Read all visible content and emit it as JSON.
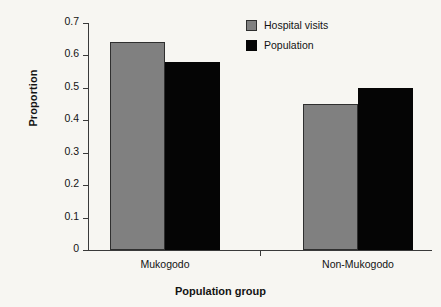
{
  "chart_data": {
    "type": "bar",
    "title": "",
    "xlabel": "Population group",
    "ylabel": "Proportion",
    "categories": [
      "Mukogodo",
      "Non-Mukogodo"
    ],
    "series": [
      {
        "name": "Hospital visits",
        "color": "#808080",
        "values": [
          0.64,
          0.45
        ]
      },
      {
        "name": "Population",
        "color": "#050505",
        "values": [
          0.58,
          0.5
        ]
      }
    ],
    "ylim": [
      0,
      0.7
    ],
    "ytick_labels": [
      "0",
      "0.1",
      "0.2",
      "0.3",
      "0.4",
      "0.5",
      "0.6",
      "0.7"
    ],
    "ytick_values": [
      0,
      0.1,
      0.2,
      0.3,
      0.4,
      0.5,
      0.6,
      0.7
    ],
    "grid": false,
    "legend_position": "top-right"
  }
}
